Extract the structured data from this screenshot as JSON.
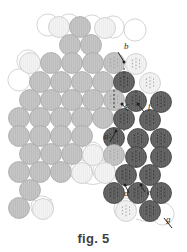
{
  "figure": {
    "caption": "fig. 5",
    "title": "fig. 5",
    "type": "packing-diagram",
    "colors": {
      "light": "#ececec",
      "light_stroke": "#c9c9c9",
      "mid": "#bdbdbd",
      "mid_stroke": "#a8a8a8",
      "dark": "#5e5e5e",
      "dark_stroke": "#3f3f3f",
      "outline": "#cfcfcf",
      "label": "#2a2a2a",
      "background": "#ffffff"
    },
    "geometry": {
      "radius": 10.5,
      "row_pitch": 18.2,
      "col_pitch": 21.0
    },
    "labels": [
      {
        "id": "a",
        "text": "a",
        "x": 104,
        "y": 139
      },
      {
        "id": "b",
        "text": "b",
        "x": 124,
        "y": 49
      },
      {
        "id": "c",
        "text": "c",
        "x": 125,
        "y": 108
      },
      {
        "id": "d",
        "text": "d",
        "x": 124,
        "y": 196
      },
      {
        "id": "e",
        "text": "e",
        "x": 147,
        "y": 195
      },
      {
        "id": "f",
        "text": "f",
        "x": 148,
        "y": 109
      },
      {
        "id": "g",
        "text": "g",
        "x": 166,
        "y": 222
      }
    ],
    "circles": [
      {
        "id": "c-0",
        "cx": 59,
        "cy": 27,
        "shade": "light"
      },
      {
        "id": "c-1",
        "cx": 80,
        "cy": 27,
        "shade": "mid"
      },
      {
        "id": "c-2",
        "cx": 105,
        "cy": 28,
        "shade": "light"
      },
      {
        "id": "c-3",
        "cx": 70,
        "cy": 45,
        "shade": "mid"
      },
      {
        "id": "c-4",
        "cx": 91,
        "cy": 45,
        "shade": "mid"
      },
      {
        "id": "c-5",
        "cx": 30,
        "cy": 63,
        "shade": "light"
      },
      {
        "id": "c-6",
        "cx": 51,
        "cy": 63,
        "shade": "mid"
      },
      {
        "id": "c-7",
        "cx": 72,
        "cy": 63,
        "shade": "mid"
      },
      {
        "id": "c-8",
        "cx": 93,
        "cy": 63,
        "shade": "mid"
      },
      {
        "id": "c-9",
        "cx": 114,
        "cy": 63,
        "shade": "mid"
      },
      {
        "id": "c-10",
        "cx": 136,
        "cy": 64,
        "shade": "light"
      },
      {
        "id": "c-11",
        "cx": 40,
        "cy": 82,
        "shade": "mid"
      },
      {
        "id": "c-12",
        "cx": 61,
        "cy": 82,
        "shade": "mid"
      },
      {
        "id": "c-13",
        "cx": 82,
        "cy": 82,
        "shade": "mid"
      },
      {
        "id": "c-14",
        "cx": 103,
        "cy": 82,
        "shade": "mid"
      },
      {
        "id": "c-15",
        "cx": 124,
        "cy": 82,
        "shade": "dark"
      },
      {
        "id": "c-16",
        "cx": 150,
        "cy": 83,
        "shade": "light"
      },
      {
        "id": "c-17",
        "cx": 30,
        "cy": 100,
        "shade": "mid"
      },
      {
        "id": "c-18",
        "cx": 51,
        "cy": 100,
        "shade": "mid"
      },
      {
        "id": "c-19",
        "cx": 72,
        "cy": 100,
        "shade": "mid"
      },
      {
        "id": "c-20",
        "cx": 93,
        "cy": 100,
        "shade": "mid"
      },
      {
        "id": "c-21",
        "cx": 114,
        "cy": 100,
        "shade": "mid"
      },
      {
        "id": "c-22",
        "cx": 136,
        "cy": 101,
        "shade": "dark"
      },
      {
        "id": "c-23",
        "cx": 161,
        "cy": 102,
        "shade": "dark"
      },
      {
        "id": "c-24",
        "cx": 19,
        "cy": 118,
        "shade": "mid"
      },
      {
        "id": "c-25",
        "cx": 40,
        "cy": 118,
        "shade": "mid"
      },
      {
        "id": "c-26",
        "cx": 61,
        "cy": 118,
        "shade": "mid"
      },
      {
        "id": "c-27",
        "cx": 82,
        "cy": 118,
        "shade": "mid"
      },
      {
        "id": "c-28",
        "cx": 103,
        "cy": 118,
        "shade": "mid"
      },
      {
        "id": "c-29",
        "cx": 124,
        "cy": 119,
        "shade": "dark"
      },
      {
        "id": "c-30",
        "cx": 150,
        "cy": 120,
        "shade": "dark"
      },
      {
        "id": "c-31",
        "cx": 19,
        "cy": 136,
        "shade": "mid"
      },
      {
        "id": "c-32",
        "cx": 40,
        "cy": 136,
        "shade": "mid"
      },
      {
        "id": "c-33",
        "cx": 61,
        "cy": 136,
        "shade": "mid"
      },
      {
        "id": "c-34",
        "cx": 82,
        "cy": 136,
        "shade": "mid"
      },
      {
        "id": "c-35",
        "cx": 114,
        "cy": 138,
        "shade": "dark"
      },
      {
        "id": "c-36",
        "cx": 138,
        "cy": 139,
        "shade": "dark"
      },
      {
        "id": "c-37",
        "cx": 161,
        "cy": 139,
        "shade": "dark"
      },
      {
        "id": "c-38",
        "cx": 30,
        "cy": 154,
        "shade": "mid"
      },
      {
        "id": "c-39",
        "cx": 51,
        "cy": 154,
        "shade": "mid"
      },
      {
        "id": "c-40",
        "cx": 72,
        "cy": 154,
        "shade": "mid"
      },
      {
        "id": "c-41",
        "cx": 93,
        "cy": 155,
        "shade": "light"
      },
      {
        "id": "c-42",
        "cx": 114,
        "cy": 155,
        "shade": "mid"
      },
      {
        "id": "c-43",
        "cx": 136,
        "cy": 157,
        "shade": "dark"
      },
      {
        "id": "c-44",
        "cx": 161,
        "cy": 157,
        "shade": "dark"
      },
      {
        "id": "c-45",
        "cx": 19,
        "cy": 172,
        "shade": "mid"
      },
      {
        "id": "c-46",
        "cx": 40,
        "cy": 172,
        "shade": "mid"
      },
      {
        "id": "c-47",
        "cx": 61,
        "cy": 172,
        "shade": "mid"
      },
      {
        "id": "c-48",
        "cx": 82,
        "cy": 173,
        "shade": "light"
      },
      {
        "id": "c-49",
        "cx": 105,
        "cy": 173,
        "shade": "light"
      },
      {
        "id": "c-50",
        "cx": 126,
        "cy": 175,
        "shade": "dark"
      },
      {
        "id": "c-51",
        "cx": 150,
        "cy": 175,
        "shade": "dark"
      },
      {
        "id": "c-52",
        "cx": 30,
        "cy": 190,
        "shade": "mid"
      },
      {
        "id": "c-53",
        "cx": 114,
        "cy": 193,
        "shade": "dark"
      },
      {
        "id": "c-54",
        "cx": 138,
        "cy": 193,
        "shade": "dark"
      },
      {
        "id": "c-55",
        "cx": 161,
        "cy": 193,
        "shade": "dark"
      },
      {
        "id": "c-56",
        "cx": 19,
        "cy": 208,
        "shade": "mid"
      },
      {
        "id": "c-57",
        "cx": 43,
        "cy": 209,
        "shade": "light"
      },
      {
        "id": "c-58",
        "cx": 126,
        "cy": 211,
        "shade": "light"
      },
      {
        "id": "c-59",
        "cx": 150,
        "cy": 211,
        "shade": "dark"
      }
    ]
  }
}
